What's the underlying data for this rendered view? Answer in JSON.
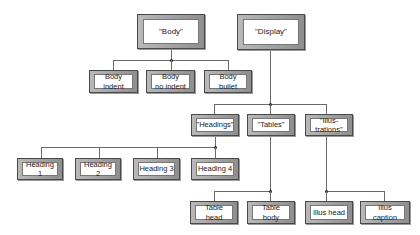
{
  "diagram": {
    "type": "hierarchy",
    "nodes": {
      "body": "\"Body\"",
      "display": "\"Display\"",
      "body_indent": "Body\nindent",
      "body_no_indent": "Body\nno indent",
      "body_bullet": "Body\nbullet",
      "headings": "\"Headings\"",
      "tables": "\"Tables\"",
      "illustrations": "\"Illus-\ntrations\"",
      "heading_1": "Heading 1",
      "heading_2": "Heading 2",
      "heading_3": "Heading 3",
      "heading_4": "Heading 4",
      "table_head": "Table head",
      "table_body": "Table body",
      "illus_head": "Illus head",
      "illus_caption": "Illus caption"
    },
    "edges": [
      [
        "body",
        "body_indent"
      ],
      [
        "body",
        "body_no_indent"
      ],
      [
        "body",
        "body_bullet"
      ],
      [
        "display",
        "headings"
      ],
      [
        "display",
        "tables"
      ],
      [
        "display",
        "illustrations"
      ],
      [
        "headings",
        "heading_1"
      ],
      [
        "headings",
        "heading_2"
      ],
      [
        "headings",
        "heading_3"
      ],
      [
        "headings",
        "heading_4"
      ],
      [
        "tables",
        "table_head"
      ],
      [
        "tables",
        "table_body"
      ],
      [
        "illustrations",
        "illus_head"
      ],
      [
        "illustrations",
        "illus_caption"
      ]
    ]
  }
}
